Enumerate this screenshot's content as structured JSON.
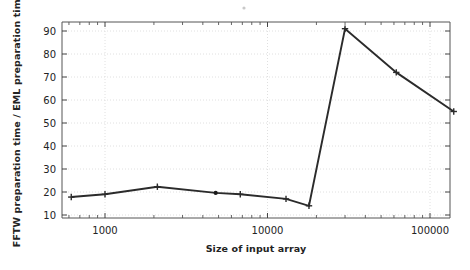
{
  "chart_data": {
    "type": "line",
    "title": "",
    "xlabel": "Size of input array",
    "ylabel": "FFTW preparation time / EML preparation time",
    "xscale": "log",
    "yscale": "linear",
    "xlim": [
      600,
      160000
    ],
    "ylim": [
      8,
      94
    ],
    "grid": true,
    "legend": false,
    "marker": "plus",
    "line_color": "#2b2b2b",
    "series": [
      {
        "name": "FFTW preparation time / EML preparation time",
        "x": [
          620,
          1000,
          2100,
          4800,
          6800,
          13000,
          18000,
          30000,
          62000,
          140000
        ],
        "y": [
          17.8,
          19.0,
          22.3,
          19.6,
          19.0,
          17.0,
          14.0,
          91.0,
          72.0,
          55.0
        ]
      }
    ],
    "x_tick_labels": [
      "1000",
      "10000",
      "100000"
    ],
    "x_tick_values": [
      1000,
      10000,
      100000
    ],
    "y_tick_labels": [
      "10",
      "20",
      "30",
      "40",
      "50",
      "60",
      "70",
      "80",
      "90"
    ],
    "y_tick_values": [
      10,
      20,
      30,
      40,
      50,
      60,
      70,
      80,
      90
    ]
  },
  "axes": {
    "x_title": "Size of input array",
    "y_title": "FFTW preparation time / EML preparation time"
  },
  "ticks": {
    "x": [
      {
        "label": "1000",
        "value": 1000
      },
      {
        "label": "10000",
        "value": 10000
      },
      {
        "label": "100000",
        "value": 100000
      }
    ],
    "y": [
      {
        "label": "90",
        "value": 90
      },
      {
        "label": "80",
        "value": 80
      },
      {
        "label": "70",
        "value": 70
      },
      {
        "label": "60",
        "value": 60
      },
      {
        "label": "50",
        "value": 50
      },
      {
        "label": "40",
        "value": 40
      },
      {
        "label": "30",
        "value": 30
      },
      {
        "label": "20",
        "value": 20
      },
      {
        "label": "10",
        "value": 10
      }
    ]
  }
}
